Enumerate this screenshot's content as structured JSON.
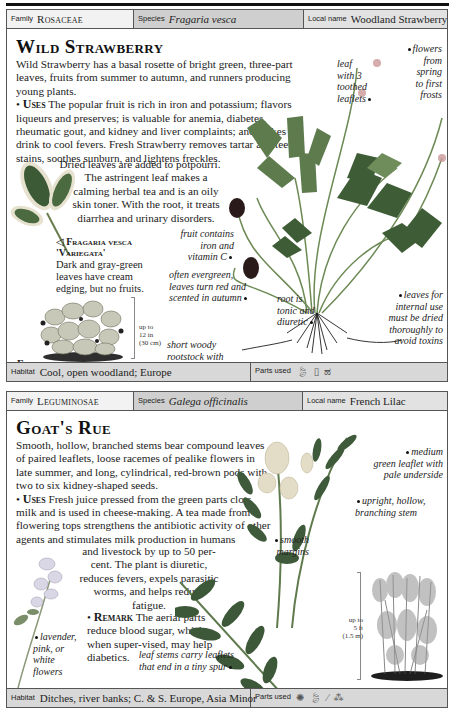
{
  "entries": [
    {
      "family_label": "Family",
      "family": "Rosaceae",
      "species_label": "Species",
      "species": "Fragaria vesca",
      "local_label": "Local name",
      "local_name": "Woodland Strawberry",
      "title": "Wild Strawberry",
      "description": "Wild Strawberry has a basal rosette of bright green, three-part leaves, fruits from summer to autumn, and runners producing young plants.",
      "uses_label": "Uses",
      "uses_text_1": " The popular fruit is rich in iron and potassium; flavors liqueurs and preserves; is valuable for anemia, diabetes, rheumatic gout, and kidney and liver complaints; and makes a drink to cool fevers. Fresh Strawberry removes tartar and teeth stains, soothes sunburn, and lightens freckles.",
      "uses_text_2": "Dried leaves are added to potpourri. The astringent leaf makes a calming herbal tea and is an oily skin toner. With the root, it treats diarrhea and urinary disorders.",
      "variety": {
        "marker": "◁",
        "title_1": "Fragaria vesca",
        "title_2": "'Variegata'",
        "text": "Dark and gray-green leaves have cream edging, but no fruits."
      },
      "whole_plant_label": "Fragaria vesca",
      "scale": [
        "up to",
        "12 in",
        "(30 cm)"
      ],
      "captions": [
        {
          "id": "flowers",
          "lines": [
            "flowers",
            "from",
            "spring",
            "to first",
            "frosts"
          ]
        },
        {
          "id": "leaf",
          "lines": [
            "leaf",
            "with 3",
            "toothed",
            "leaflets"
          ]
        },
        {
          "id": "fruit",
          "lines": [
            "fruit contains",
            "iron and",
            "vitamin C"
          ]
        },
        {
          "id": "evergreen",
          "lines": [
            "often evergreen,",
            "leaves turn red and",
            "scented in autumn"
          ]
        },
        {
          "id": "root",
          "lines": [
            "root is",
            "tonic and",
            "diuretic"
          ]
        },
        {
          "id": "leaves-internal",
          "lines": [
            "leaves for",
            "internal use",
            "must be dried",
            "thoroughly to",
            "avoid toxins"
          ]
        },
        {
          "id": "rootstock",
          "lines": [
            "short woody",
            "rootstock with",
            "numerous rootlets"
          ]
        }
      ],
      "habitat_label": "Habitat",
      "habitat": "Cool, open woodland; Europe",
      "parts_label": "Parts used",
      "parts_icons": [
        "leaf-icon",
        "root-icon",
        "fruit-icon"
      ]
    },
    {
      "family_label": "Family",
      "family": "Leguminosae",
      "species_label": "Species",
      "species": "Galega officinalis",
      "local_label": "Local name",
      "local_name": "French Lilac",
      "title": "Goat's Rue",
      "description": "Smooth, hollow, branched stems bear compound leaves of paired leaflets, loose racemes of pealike flowers in late summer, and long, cylindrical, red-brown pods with two to six kidney-shaped seeds.",
      "uses_label": "Uses",
      "uses_text_1": " Fresh juice pressed from the green parts clots milk and is used in cheese-making. A tea made from flowering tops strengthens the antibiotic activity of other agents and stimulates milk production in humans",
      "uses_text_2": "and livestock by up to 50 per-cent. The plant is diuretic, reduces fevers, expels parasitic worms, and helps reduce fatigue.",
      "remark_label": "Remark",
      "remark_text": " The aerial parts reduce blood sugar, which, when super-vised, may help diabetics.",
      "scale": [
        "up to",
        "5 ft",
        "(1.5 m)"
      ],
      "captions": [
        {
          "id": "medium-green",
          "lines": [
            "medium",
            "green leaflet with",
            "pale underside"
          ]
        },
        {
          "id": "upright-stem",
          "lines": [
            "upright, hollow,",
            "branching stem"
          ]
        },
        {
          "id": "smooth-margins",
          "lines": [
            "smooth",
            "margins"
          ]
        },
        {
          "id": "flowers",
          "lines": [
            "lavender,",
            "pink, or",
            "white",
            "flowers"
          ]
        },
        {
          "id": "leaf-stems",
          "lines": [
            "leaf stems carry leaflets",
            "that end in a tiny spur"
          ]
        }
      ],
      "habitat_label": "Habitat",
      "habitat": "Ditches, river banks; C. & S. Europe, Asia Minor",
      "parts_label": "Parts used",
      "parts_icons": [
        "flower-icon",
        "leaf-icon",
        "stem-icon",
        "seed-icon"
      ]
    }
  ],
  "colors": {
    "header_species_bg": "#cfcfcf",
    "header_family_bg": "#f2f2f2",
    "header_local_bg": "#e2e2e2",
    "footer_bg": "#d8d8d8",
    "leaf_green": "#4f6b45",
    "strawberry_red": "#3a2020"
  }
}
